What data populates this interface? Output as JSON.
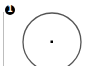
{
  "step": {
    "number": "1"
  },
  "figure": {
    "shape": "circle-with-center-point",
    "stroke_color": "#555555",
    "center_color": "#000000"
  }
}
